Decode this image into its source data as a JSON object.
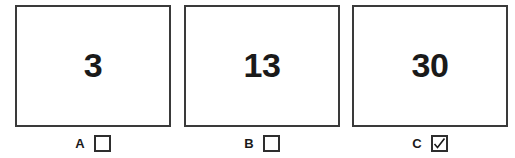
{
  "figure": {
    "type": "multiple-choice-panels",
    "background_color": "#ffffff",
    "border_color": "#3a3a3a",
    "text_color": "#1a1a1a",
    "clipped_caption_a": "",
    "clipped_caption_b": ""
  },
  "panels": [
    {
      "id": "a",
      "value": "3",
      "label": "A",
      "checked": false,
      "checkbox_state": "unchecked",
      "check_glyph": ""
    },
    {
      "id": "b",
      "value": "13",
      "label": "B",
      "checked": false,
      "checkbox_state": "unchecked",
      "check_glyph": ""
    },
    {
      "id": "c",
      "value": "30",
      "label": "C",
      "checked": true,
      "checkbox_state": "checked",
      "check_glyph": "✓"
    }
  ]
}
